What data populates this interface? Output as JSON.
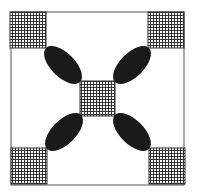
{
  "canvas": {
    "width": 197,
    "height": 196,
    "background": "#ffffff"
  },
  "colors": {
    "frame": "#555555",
    "grid_line": "#333333",
    "grid_fill": "#ffffff",
    "ellipse_fill": "#1a1a1a"
  },
  "frame": {
    "x": 11,
    "y": 12,
    "width": 173,
    "height": 173
  },
  "grid_spacing": 3,
  "grid_squares": [
    {
      "id": "top-left",
      "x": 10,
      "y": 12,
      "size": 36
    },
    {
      "id": "top-right",
      "x": 148,
      "y": 12,
      "size": 36
    },
    {
      "id": "bottom-left",
      "x": 11,
      "y": 148,
      "size": 36
    },
    {
      "id": "bottom-right",
      "x": 149,
      "y": 148,
      "size": 36
    },
    {
      "id": "center",
      "x": 80,
      "y": 81,
      "size": 35
    }
  ],
  "ellipses": [
    {
      "id": "top-left",
      "cx": 63,
      "cy": 65,
      "rx": 24,
      "ry": 12,
      "angle": 45
    },
    {
      "id": "top-right",
      "cx": 132,
      "cy": 65,
      "rx": 24,
      "ry": 12,
      "angle": -45
    },
    {
      "id": "bottom-left",
      "cx": 64,
      "cy": 132,
      "rx": 24,
      "ry": 12,
      "angle": -45
    },
    {
      "id": "bottom-right",
      "cx": 132,
      "cy": 132,
      "rx": 24,
      "ry": 12,
      "angle": 45
    }
  ]
}
